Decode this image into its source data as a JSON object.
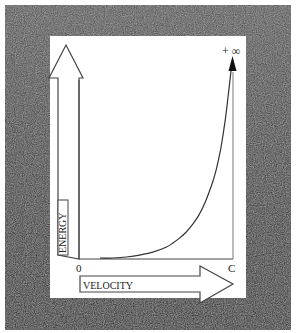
{
  "colors": {
    "background": "#ffffff",
    "frame": "#2b2b2b",
    "panel": "#ffffff",
    "ink": "#333333"
  },
  "chart_data": {
    "type": "line",
    "title": "",
    "xlabel": "VELOCITY",
    "ylabel": "ENERGY",
    "x_tick_labels": [
      "0",
      "C"
    ],
    "y_top_annotation": "+ ∞",
    "xlim": [
      0,
      1
    ],
    "ylim": [
      0,
      1
    ],
    "grid": false,
    "legend": "none",
    "series": [
      {
        "name": "energy-vs-velocity",
        "x": [
          0.0,
          0.1,
          0.2,
          0.3,
          0.4,
          0.5,
          0.55,
          0.6,
          0.65,
          0.7,
          0.75,
          0.8,
          0.85,
          0.88,
          0.91,
          0.93,
          0.95,
          0.97,
          0.985,
          1.0
        ],
        "y": [
          0.0,
          0.0,
          0.005,
          0.015,
          0.03,
          0.055,
          0.075,
          0.1,
          0.13,
          0.17,
          0.22,
          0.29,
          0.38,
          0.45,
          0.54,
          0.62,
          0.71,
          0.82,
          0.91,
          1.0
        ]
      }
    ],
    "asymptote_x": 1.0
  }
}
